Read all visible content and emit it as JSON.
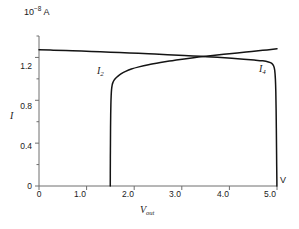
{
  "figure": {
    "background_color": "#ffffff",
    "curve_color": "#141414",
    "axis_color": "#6e6e6e",
    "y_unit_mantissa": "10",
    "y_unit_exponent": "−8",
    "y_unit_suffix": "A",
    "y_axis_name": "I",
    "x_axis_name_base": "V",
    "x_axis_name_sub": "out",
    "x_unit_label": "V"
  },
  "chart_data": {
    "type": "line",
    "title": "",
    "xlabel": "V_out",
    "ylabel": "I",
    "x_unit": "V",
    "y_unit": "10^-8 A",
    "xlim": [
      0,
      5.0
    ],
    "ylim": [
      0,
      1.4
    ],
    "grid": false,
    "legend_position": "inline-annotation",
    "xticks": [
      0,
      1.0,
      2.0,
      3.0,
      4.0,
      5.0
    ],
    "xtick_labels": [
      "0",
      "1.0",
      "2.0",
      "3.0",
      "4.0",
      "5.0"
    ],
    "yticks": [
      0,
      0.4,
      0.8,
      1.2
    ],
    "ytick_labels": [
      "0",
      "0.4",
      "0.8",
      "1.2"
    ],
    "y_minor_ticks": [
      0.2,
      0.6,
      1.0,
      1.4
    ],
    "annotations": [
      {
        "text": "I2",
        "base": "I",
        "sub": "2",
        "x": 1.62,
        "y": 1.02
      },
      {
        "text": "I4",
        "base": "I",
        "sub": "4",
        "x": 4.62,
        "y": 1.12
      }
    ],
    "series": [
      {
        "name": "I2",
        "label_base": "I",
        "label_sub": "2",
        "description": "Rises vertically near V=1.5, knee at I=0.95, then slowly increasing to upper right",
        "points": [
          [
            1.497,
            0.0
          ],
          [
            1.498,
            0.12
          ],
          [
            1.499,
            0.26
          ],
          [
            1.501,
            0.4
          ],
          [
            1.503,
            0.54
          ],
          [
            1.506,
            0.66
          ],
          [
            1.51,
            0.76
          ],
          [
            1.516,
            0.84
          ],
          [
            1.524,
            0.9
          ],
          [
            1.536,
            0.94
          ],
          [
            1.552,
            0.965
          ],
          [
            1.575,
            0.985
          ],
          [
            1.61,
            1.005
          ],
          [
            1.66,
            1.025
          ],
          [
            1.73,
            1.048
          ],
          [
            1.82,
            1.07
          ],
          [
            1.94,
            1.092
          ],
          [
            2.1,
            1.112
          ],
          [
            2.3,
            1.132
          ],
          [
            2.55,
            1.152
          ],
          [
            2.8,
            1.17
          ],
          [
            3.05,
            1.186
          ],
          [
            3.35,
            1.203
          ],
          [
            3.65,
            1.218
          ],
          [
            4.0,
            1.234
          ],
          [
            4.35,
            1.25
          ],
          [
            4.7,
            1.266
          ],
          [
            5.0,
            1.28
          ]
        ]
      },
      {
        "name": "I4",
        "label_base": "I",
        "label_sub": "4",
        "description": "Starts at I=1.27 at V=0, gently declines, flattens near 1.15, then falls vertically at V=4.95",
        "points": [
          [
            0.0,
            1.272
          ],
          [
            0.3,
            1.268
          ],
          [
            0.7,
            1.262
          ],
          [
            1.1,
            1.256
          ],
          [
            1.5,
            1.249
          ],
          [
            1.9,
            1.242
          ],
          [
            2.3,
            1.234
          ],
          [
            2.7,
            1.226
          ],
          [
            3.05,
            1.218
          ],
          [
            3.4,
            1.21
          ],
          [
            3.75,
            1.201
          ],
          [
            4.05,
            1.192
          ],
          [
            4.3,
            1.184
          ],
          [
            4.52,
            1.176
          ],
          [
            4.7,
            1.168
          ],
          [
            4.82,
            1.158
          ],
          [
            4.89,
            1.145
          ],
          [
            4.93,
            1.12
          ],
          [
            4.952,
            1.08
          ],
          [
            4.966,
            1.0
          ],
          [
            4.975,
            0.88
          ],
          [
            4.981,
            0.72
          ],
          [
            4.986,
            0.54
          ],
          [
            4.99,
            0.36
          ],
          [
            4.994,
            0.18
          ],
          [
            4.997,
            0.06
          ],
          [
            4.998,
            0.0
          ]
        ]
      }
    ]
  }
}
